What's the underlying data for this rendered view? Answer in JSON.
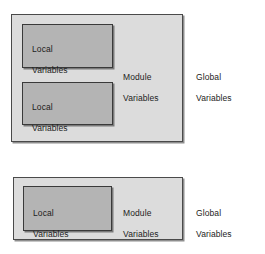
{
  "diagram_title": "Variable Scope Diagram",
  "colors": {
    "background": "#ffffff",
    "module_fill": "#dcdcdc",
    "local_fill": "#b4b4b4",
    "module_border": "#4a4a4a",
    "local_border": "#3a3a3a",
    "text": "#1c1c1c"
  },
  "scopes": [
    {
      "id": "top",
      "module": {
        "label_line_1": "Module",
        "label_line_2": "Variables"
      },
      "global": {
        "label_line_1": "Global",
        "label_line_2": "Variables"
      },
      "locals": [
        {
          "label_line_1": "Local",
          "label_line_2": "Variables"
        },
        {
          "label_line_1": "Local",
          "label_line_2": "Variables"
        }
      ]
    },
    {
      "id": "bottom",
      "module": {
        "label_line_1": "Module",
        "label_line_2": "Variables"
      },
      "global": {
        "label_line_1": "Global",
        "label_line_2": "Variables"
      },
      "locals": [
        {
          "label_line_1": "Local",
          "label_line_2": "Variables"
        }
      ]
    }
  ]
}
